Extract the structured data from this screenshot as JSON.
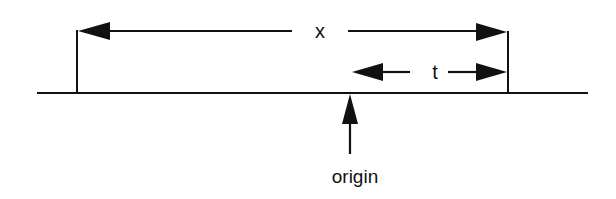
{
  "diagram": {
    "colors": {
      "stroke": "#111111",
      "background": "#ffffff"
    },
    "baseline": {
      "x1": 37,
      "x2": 588,
      "y": 93
    },
    "ticks": [
      {
        "name": "left-tick",
        "x": 77,
        "y1": 30,
        "y2": 93
      },
      {
        "name": "right-tick",
        "x": 508,
        "y1": 31,
        "y2": 93
      }
    ],
    "dimension_x": {
      "label": "x",
      "y": 31,
      "x_start": 77,
      "x_end": 508,
      "label_x": 320,
      "gap_start": 292,
      "gap_end": 348
    },
    "dimension_t": {
      "label": "t",
      "y": 72,
      "x_start": 352,
      "x_end": 508,
      "label_x": 435,
      "gap_start": 414,
      "gap_end": 449
    },
    "origin_arrow": {
      "label": "origin",
      "x": 350,
      "y_tip": 94,
      "y_tail": 152,
      "label_y": 182
    }
  }
}
